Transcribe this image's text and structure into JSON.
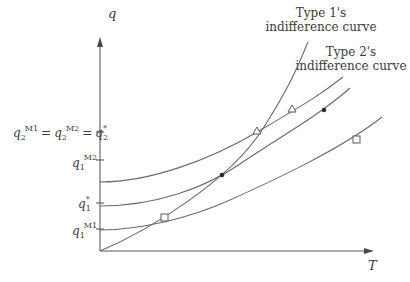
{
  "diagram": {
    "axes": {
      "y_label": "q",
      "x_label": "T"
    },
    "y_ticks": [
      {
        "id": "q2",
        "label_html": "q2^M1 = q2^M2 = q*2",
        "parts": {
          "a": "q",
          "a_sub": "2",
          "a_sup": "M1",
          "eq1": "=",
          "b": "q",
          "b_sub": "2",
          "b_sup": "M2",
          "eq2": "=",
          "c": "q",
          "c_sub": "2",
          "c_sup": "*"
        },
        "y": 132
      },
      {
        "id": "q1M2",
        "parts": {
          "a": "q",
          "a_sub": "1",
          "a_sup": "M2"
        },
        "y": 160
      },
      {
        "id": "q1star",
        "parts": {
          "a": "q",
          "a_sub": "1",
          "a_sup": "*"
        },
        "y": 203
      },
      {
        "id": "q1M1",
        "parts": {
          "a": "q",
          "a_sub": "1",
          "a_sup": "M1"
        },
        "y": 229
      }
    ],
    "curve_labels": {
      "type1_line1": "Type 1's",
      "type1_line2": "indifference curve",
      "type2_line1": "Type 2's",
      "type2_line2": "indifference curve"
    },
    "markers": [
      {
        "shape": "square",
        "meaning": "type 1 at low contract"
      },
      {
        "shape": "dot",
        "meaning": "intersection type 1 / type 2 middle"
      },
      {
        "shape": "triangle",
        "meaning": "intersection type 1 / type 2 upper"
      },
      {
        "shape": "triangle",
        "meaning": "type 2 upper curve"
      },
      {
        "shape": "dot",
        "meaning": "type 2 middle curve"
      },
      {
        "shape": "square",
        "meaning": "type 2 lower curve"
      }
    ],
    "colors": {
      "line": "#6a6a6a",
      "text": "#3a3a3a",
      "background": "#ffffff"
    }
  }
}
